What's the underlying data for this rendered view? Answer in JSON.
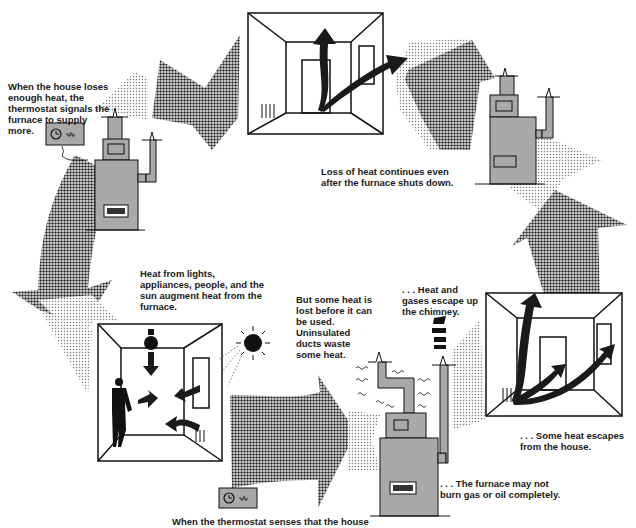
{
  "diagram": {
    "type": "cycle",
    "colors": {
      "background": "#ffffff",
      "dark_arrow": "#3a3a3a",
      "light_arrow": "#bdbdbd",
      "furnace_fill": "#a9a9a9",
      "line": "#111111",
      "text": "#1a1a1a"
    },
    "captions": {
      "thermostat_signals": {
        "lines": [
          "When the house loses",
          "enough heat, the",
          "thermostat signals the",
          "furnace to supply",
          "more."
        ]
      },
      "heat_continues": {
        "lines": [
          "Loss of heat continues even",
          "after the furnace shuts down."
        ]
      },
      "heat_augment": {
        "lines": [
          "Heat from lights,",
          "appliances, people, and the",
          "sun augment heat from the",
          "furnace."
        ]
      },
      "duct_loss": {
        "lines": [
          "But some heat is",
          "lost before it can",
          "be used.",
          "Uninsulated",
          "ducts waste",
          "some heat."
        ]
      },
      "chimney_loss": {
        "lines": [
          ". . . Heat and",
          "gases escape up",
          "the chimney."
        ]
      },
      "house_escape": {
        "lines": [
          ". . . Some heat escapes",
          "from the house."
        ]
      },
      "incomplete_burn": {
        "lines": [
          ". . . The furnace may not",
          "burn gas or oil completely."
        ]
      },
      "thermostat_senses": {
        "lines": [
          "When the thermostat senses that the house"
        ]
      }
    },
    "scenes": [
      {
        "id": "room-top",
        "label": "room with heat rising and escaping through window"
      },
      {
        "id": "furnace-left",
        "label": "furnace with thermostat signaling"
      },
      {
        "id": "furnace-right",
        "label": "furnace shut down"
      },
      {
        "id": "room-left",
        "label": "room with lightbulb, person, sun, and register"
      },
      {
        "id": "furnace-bottom",
        "label": "furnace losing heat through ducts and chimney"
      },
      {
        "id": "room-right",
        "label": "room with heat escaping through door and window"
      }
    ],
    "icons": [
      "thermostat-icon",
      "lightbulb-icon",
      "sun-icon",
      "person-icon",
      "furnace-icon",
      "register-icon"
    ]
  }
}
